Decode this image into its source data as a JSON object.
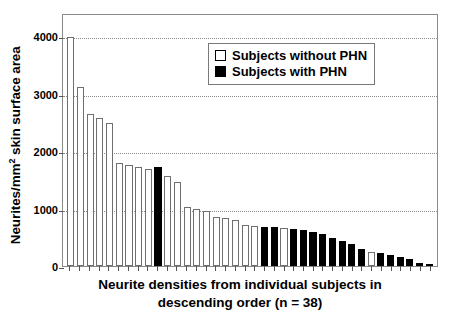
{
  "chart_data": {
    "type": "bar",
    "title": "",
    "subtitle": "",
    "xlabel_line1": "Neurite densities from individual subjects in",
    "xlabel_line2": "descending order (n = 38)",
    "ylabel_main": "Neurites/mm",
    "ylabel_sup": "2",
    "ylabel_tail": " skin surface area",
    "ylim": [
      0,
      4400
    ],
    "yticks": [
      0,
      1000,
      2000,
      3000,
      4000
    ],
    "ytick_labels": [
      "0",
      "1000",
      "2000",
      "3000",
      "4000"
    ],
    "grid": "horizontal-dotted",
    "legend_position": "top-right-inside",
    "categories": [
      1,
      2,
      3,
      4,
      5,
      6,
      7,
      8,
      9,
      10,
      11,
      12,
      13,
      14,
      15,
      16,
      17,
      18,
      19,
      20,
      21,
      22,
      23,
      24,
      25,
      26,
      27,
      28,
      29,
      30,
      31,
      32,
      33,
      34,
      35,
      36,
      37,
      38
    ],
    "values": [
      3980,
      3120,
      2650,
      2580,
      2480,
      1790,
      1760,
      1730,
      1690,
      1720,
      1560,
      1460,
      1020,
      990,
      960,
      860,
      830,
      800,
      720,
      700,
      680,
      670,
      660,
      640,
      620,
      600,
      560,
      480,
      430,
      380,
      300,
      250,
      230,
      200,
      150,
      120,
      60,
      25
    ],
    "groups": [
      "open",
      "open",
      "open",
      "open",
      "open",
      "open",
      "open",
      "open",
      "open",
      "filled",
      "open",
      "open",
      "open",
      "open",
      "open",
      "open",
      "open",
      "open",
      "open",
      "open",
      "filled",
      "filled",
      "open",
      "filled",
      "filled",
      "filled",
      "filled",
      "filled",
      "filled",
      "filled",
      "filled",
      "open",
      "filled",
      "filled",
      "filled",
      "filled",
      "filled",
      "filled"
    ],
    "legend": [
      {
        "key": "open",
        "label": "Subjects without PHN",
        "color": "#ffffff"
      },
      {
        "key": "filled",
        "label": "Subjects with PHN",
        "color": "#000000"
      }
    ],
    "colors": {
      "open_fill": "#ffffff",
      "open_edge": "#6f6f6f",
      "filled_fill": "#000000",
      "axis": "#8a8a8a",
      "grid": "#888888",
      "text": "#000000"
    }
  }
}
